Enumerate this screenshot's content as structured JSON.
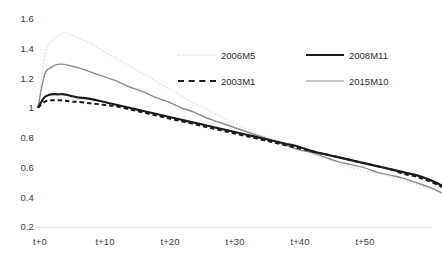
{
  "chart_data": {
    "type": "line",
    "title": "",
    "xlabel": "",
    "ylabel": "",
    "ylim": [
      0.2,
      1.6
    ],
    "yticks": [
      1.6,
      1.4,
      1.2,
      1.0,
      0.8,
      0.6,
      0.4,
      0.2
    ],
    "ytick_labels": [
      "1.6",
      "1.4",
      "1.2",
      "1",
      "0.8",
      "0.6",
      "0.4",
      "0.2"
    ],
    "xlim": [
      0,
      62
    ],
    "xticks": [
      0,
      10,
      20,
      30,
      40,
      50
    ],
    "xtick_labels": [
      "t+0",
      "t+10",
      "t+20",
      "t+30",
      "t+40",
      "t+50"
    ],
    "grid": false,
    "legend_position": "upper-center",
    "x": [
      0,
      1,
      2,
      3,
      4,
      5,
      6,
      8,
      10,
      12,
      14,
      16,
      18,
      20,
      22,
      24,
      26,
      28,
      30,
      32,
      34,
      36,
      38,
      40,
      42,
      44,
      46,
      48,
      50,
      52,
      54,
      56,
      58,
      60,
      62
    ],
    "series": [
      {
        "name": "2006M5",
        "style": "dotted",
        "color": "#d9d9d9",
        "width": 1.3,
        "values": [
          1.0,
          1.34,
          1.44,
          1.48,
          1.5,
          1.49,
          1.47,
          1.43,
          1.38,
          1.33,
          1.28,
          1.23,
          1.18,
          1.13,
          1.08,
          1.03,
          0.99,
          0.94,
          0.9,
          0.86,
          0.82,
          0.79,
          0.75,
          0.72,
          0.69,
          0.66,
          0.63,
          0.6,
          0.58,
          0.56,
          0.54,
          0.52,
          0.49,
          0.46,
          0.43
        ]
      },
      {
        "name": "2003M1",
        "style": "dashed",
        "color": "#1a1a1a",
        "width": 2.0,
        "values": [
          1.0,
          1.04,
          1.05,
          1.05,
          1.05,
          1.04,
          1.04,
          1.03,
          1.02,
          1.01,
          0.99,
          0.97,
          0.95,
          0.93,
          0.91,
          0.89,
          0.87,
          0.85,
          0.83,
          0.81,
          0.79,
          0.77,
          0.75,
          0.73,
          0.71,
          0.69,
          0.67,
          0.65,
          0.63,
          0.61,
          0.59,
          0.56,
          0.54,
          0.51,
          0.47
        ]
      },
      {
        "name": "2008M11",
        "style": "solid",
        "color": "#1a1a1a",
        "width": 2.2,
        "values": [
          1.0,
          1.07,
          1.09,
          1.09,
          1.09,
          1.08,
          1.07,
          1.06,
          1.04,
          1.02,
          1.0,
          0.98,
          0.96,
          0.94,
          0.92,
          0.9,
          0.88,
          0.86,
          0.84,
          0.82,
          0.8,
          0.78,
          0.76,
          0.74,
          0.71,
          0.69,
          0.67,
          0.65,
          0.63,
          0.61,
          0.59,
          0.57,
          0.55,
          0.52,
          0.48
        ]
      },
      {
        "name": "2015M10",
        "style": "solid",
        "color": "#8c8c8c",
        "width": 1.4,
        "values": [
          1.0,
          1.22,
          1.27,
          1.29,
          1.29,
          1.28,
          1.27,
          1.24,
          1.21,
          1.18,
          1.14,
          1.11,
          1.07,
          1.04,
          1.0,
          0.97,
          0.93,
          0.9,
          0.87,
          0.84,
          0.81,
          0.78,
          0.75,
          0.72,
          0.7,
          0.67,
          0.64,
          0.62,
          0.6,
          0.57,
          0.55,
          0.53,
          0.5,
          0.47,
          0.43
        ]
      }
    ],
    "legend": [
      {
        "label": "2006M5",
        "key": "dotted-light"
      },
      {
        "label": "2008M11",
        "key": "solid-thick-black"
      },
      {
        "label": "2003M1",
        "key": "dashed-black"
      },
      {
        "label": "2015M10",
        "key": "solid-thin-gray"
      }
    ]
  }
}
